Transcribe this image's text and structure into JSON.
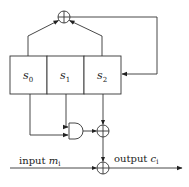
{
  "diagram": {
    "registers": [
      {
        "id": "s0",
        "base": "s",
        "sub": "0"
      },
      {
        "id": "s1",
        "base": "s",
        "sub": "1"
      },
      {
        "id": "s2",
        "base": "s",
        "sub": "2"
      }
    ],
    "input": {
      "word": "input",
      "var": "m",
      "sub": "i"
    },
    "output": {
      "word": "output",
      "var": "c",
      "sub": "i"
    },
    "nodes": [
      {
        "id": "xor-feedback",
        "type": "xor"
      },
      {
        "id": "and-gate",
        "type": "and"
      },
      {
        "id": "xor-filter",
        "type": "xor"
      },
      {
        "id": "xor-output",
        "type": "xor"
      }
    ],
    "edges": [
      {
        "from": "s0",
        "to": "xor-feedback"
      },
      {
        "from": "s2",
        "to": "xor-feedback"
      },
      {
        "from": "xor-feedback",
        "to": "s2"
      },
      {
        "from": "s0",
        "to": "and-gate"
      },
      {
        "from": "s1",
        "to": "and-gate"
      },
      {
        "from": "and-gate",
        "to": "xor-filter"
      },
      {
        "from": "s2",
        "to": "xor-filter"
      },
      {
        "from": "xor-filter",
        "to": "xor-output"
      },
      {
        "from": "input",
        "to": "xor-output"
      },
      {
        "from": "xor-output",
        "to": "output"
      }
    ],
    "colors": {
      "stroke": "#333333",
      "background": "#ffffff"
    }
  }
}
